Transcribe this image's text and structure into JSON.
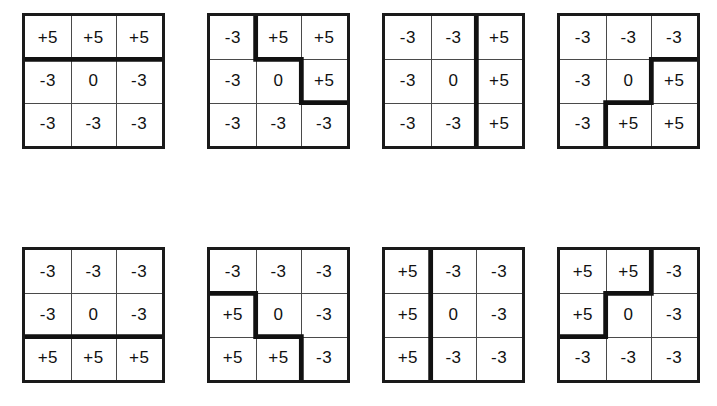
{
  "sheet": {
    "cell_values": {
      "positive": "+5",
      "negative": "-3",
      "center": "0"
    },
    "stroke_color": "#111111",
    "gridline_color": "#4a4a4a",
    "background_color": "#ffffff"
  },
  "kernels": [
    {
      "index": 1,
      "name": "kernel-north",
      "rows": [
        [
          "+5",
          "+5",
          "+5"
        ],
        [
          "-3",
          "0",
          "-3"
        ],
        [
          "-3",
          "-3",
          "-3"
        ]
      ],
      "boundary_path": "M 0 45.33 L 143 45.33"
    },
    {
      "index": 2,
      "name": "kernel-northeast",
      "rows": [
        [
          "-3",
          "+5",
          "+5"
        ],
        [
          "-3",
          "0",
          "+5"
        ],
        [
          "-3",
          "-3",
          "-3"
        ]
      ],
      "boundary_path": "M 47.66 0 L 47.66 45.33 L 95.33 45.33 L 95.33 90.66 L 143 90.66"
    },
    {
      "index": 3,
      "name": "kernel-east",
      "rows": [
        [
          "-3",
          "-3",
          "+5"
        ],
        [
          "-3",
          "0",
          "+5"
        ],
        [
          "-3",
          "-3",
          "+5"
        ]
      ],
      "boundary_path": "M 95.33 0 L 95.33 136"
    },
    {
      "index": 4,
      "name": "kernel-southeast",
      "rows": [
        [
          "-3",
          "-3",
          "-3"
        ],
        [
          "-3",
          "0",
          "+5"
        ],
        [
          "-3",
          "+5",
          "+5"
        ]
      ],
      "boundary_path": "M 143 45.33 L 95.33 45.33 L 95.33 90.66 L 47.66 90.66 L 47.66 136"
    },
    {
      "index": 5,
      "name": "kernel-south",
      "rows": [
        [
          "-3",
          "-3",
          "-3"
        ],
        [
          "-3",
          "0",
          "-3"
        ],
        [
          "+5",
          "+5",
          "+5"
        ]
      ],
      "boundary_path": "M 0 90.66 L 143 90.66"
    },
    {
      "index": 6,
      "name": "kernel-southwest",
      "rows": [
        [
          "-3",
          "-3",
          "-3"
        ],
        [
          "+5",
          "0",
          "-3"
        ],
        [
          "+5",
          "+5",
          "-3"
        ]
      ],
      "boundary_path": "M 0 45.33 L 47.66 45.33 L 47.66 90.66 L 95.33 90.66 L 95.33 136"
    },
    {
      "index": 7,
      "name": "kernel-west",
      "rows": [
        [
          "+5",
          "-3",
          "-3"
        ],
        [
          "+5",
          "0",
          "-3"
        ],
        [
          "+5",
          "-3",
          "-3"
        ]
      ],
      "boundary_path": "M 47.66 0 L 47.66 136"
    },
    {
      "index": 8,
      "name": "kernel-northwest",
      "rows": [
        [
          "+5",
          "+5",
          "-3"
        ],
        [
          "+5",
          "0",
          "-3"
        ],
        [
          "-3",
          "-3",
          "-3"
        ]
      ],
      "boundary_path": "M 95.33 0 L 95.33 45.33 L 47.66 45.33 L 47.66 90.66 L 0 90.66"
    }
  ]
}
